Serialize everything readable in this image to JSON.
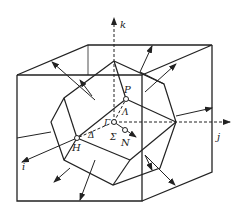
{
  "diagram": {
    "title": "",
    "axes": {
      "k": "k",
      "j": "j",
      "i": "i"
    },
    "points": {
      "P": "P",
      "Gamma": "Γ",
      "H": "H",
      "N": "N"
    },
    "lines": {
      "Lambda": "Λ",
      "Delta": "Δ",
      "Sigma": "Σ"
    }
  }
}
